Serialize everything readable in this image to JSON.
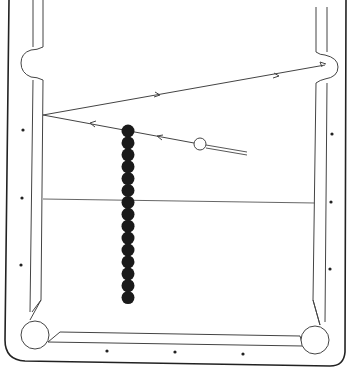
{
  "diagram": {
    "type": "billiards-table-shot-diagram",
    "colors": {
      "line": "#333333",
      "ball_fill": "#1a1a1a",
      "cue_ball_fill": "#ffffff",
      "background": "#ffffff"
    },
    "object_balls": {
      "count": 15,
      "x": 128,
      "y_start": 131,
      "spacing": 11.9,
      "radius": 6.5
    },
    "cue_ball": {
      "x": 200,
      "y": 144,
      "radius": 6
    },
    "shot_path": [
      {
        "from": [
          246,
          154
        ],
        "to": [
          40,
          115
        ],
        "label": "cue-ball-travel-to-rail"
      },
      {
        "from": [
          40,
          115
        ],
        "to": [
          327,
          65
        ],
        "label": "cue-ball-travel-to-corner-pocket"
      }
    ],
    "reference_line": {
      "y_left": 199,
      "y_right": 203
    },
    "diamonds": {
      "left": [
        [
          23,
          130
        ],
        [
          22,
          198
        ],
        [
          21,
          265
        ]
      ],
      "right": [
        [
          332,
          134
        ],
        [
          331,
          202
        ],
        [
          330,
          269
        ]
      ],
      "bottom": [
        [
          107,
          351
        ],
        [
          175,
          352
        ],
        [
          243,
          354
        ]
      ]
    }
  }
}
